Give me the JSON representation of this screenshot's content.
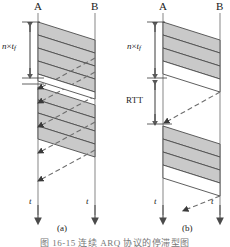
{
  "figure": {
    "caption": "图 16-15   连续 ARQ 协议的停滞型图",
    "panels": [
      {
        "id": "a",
        "label": "(a)",
        "sender_label": "A",
        "receiver_label": "B",
        "time_axis_label": "t",
        "measure_label_prefix": "n",
        "measure_label_times": "×",
        "measure_label_base": "t",
        "measure_label_sub": "f",
        "frames": 8,
        "acks": 5
      },
      {
        "id": "b",
        "label": "(b)",
        "sender_label": "A",
        "receiver_label": "B",
        "time_axis_label": "t",
        "measure_label_prefix": "n",
        "measure_label_times": "×",
        "measure_label_base": "t",
        "measure_label_sub": "f",
        "rtt_label": "RTT",
        "frames_group1": 3,
        "frames_group2": 3,
        "acks": 2
      }
    ],
    "colors": {
      "frame_fill": "#c9c9c9",
      "frame_stroke": "#4d4d4d",
      "line": "#8c8c8c",
      "ack": "#6e6e6e",
      "text": "#1a1a1a",
      "caption": "#777777"
    }
  }
}
